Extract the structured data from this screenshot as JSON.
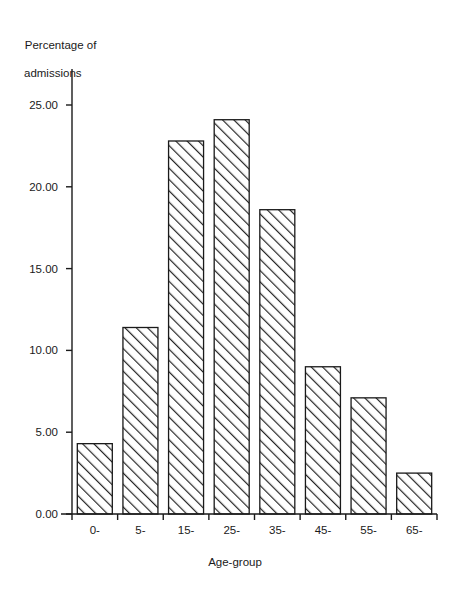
{
  "chart_data": {
    "type": "bar",
    "title": "",
    "subtitle": "",
    "xlabel": "Age-group",
    "ylabel": "Percentage of admissions",
    "ylabel_lines": [
      "Percentage of",
      "admissions"
    ],
    "categories": [
      "0-",
      "5-",
      "15-",
      "25-",
      "35-",
      "45-",
      "55-",
      "65-"
    ],
    "values": [
      4.3,
      11.4,
      22.8,
      24.1,
      18.6,
      9.0,
      7.1,
      2.5
    ],
    "ytick_labels": [
      "0.00",
      "5.00",
      "10.00",
      "15.00",
      "20.00",
      "25.00"
    ],
    "ytick_values": [
      0,
      5,
      10,
      15,
      20,
      25
    ],
    "ylim": [
      0,
      25
    ],
    "grid": false,
    "legend": null,
    "bar_fill": "#ffffff",
    "bar_edge": "#1a1a1a",
    "bar_hatch": "forward-diagonal",
    "axis_color": "#1a1a1a"
  }
}
